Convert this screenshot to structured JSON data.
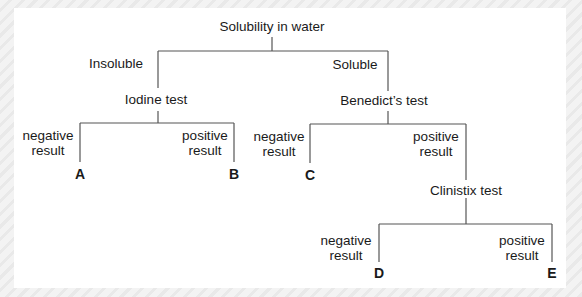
{
  "diagram": {
    "type": "identification-key-tree",
    "root": {
      "label": "Solubility in water",
      "branches": [
        {
          "branch_label": "Insoluble",
          "node": {
            "label": "Iodine test",
            "branches": [
              {
                "branch_label": "negative\nresult",
                "leaf": "A"
              },
              {
                "branch_label": "positive\nresult",
                "leaf": "B"
              }
            ]
          }
        },
        {
          "branch_label": "Soluble",
          "node": {
            "label": "Benedict’s test",
            "branches": [
              {
                "branch_label": "negative\nresult",
                "leaf": "C"
              },
              {
                "branch_label": "positive\nresult",
                "node": {
                  "label": "Clinistix test",
                  "branches": [
                    {
                      "branch_label": "negative\nresult",
                      "leaf": "D"
                    },
                    {
                      "branch_label": "positive\nresult",
                      "leaf": "E"
                    }
                  ]
                }
              }
            ]
          }
        }
      ]
    }
  }
}
